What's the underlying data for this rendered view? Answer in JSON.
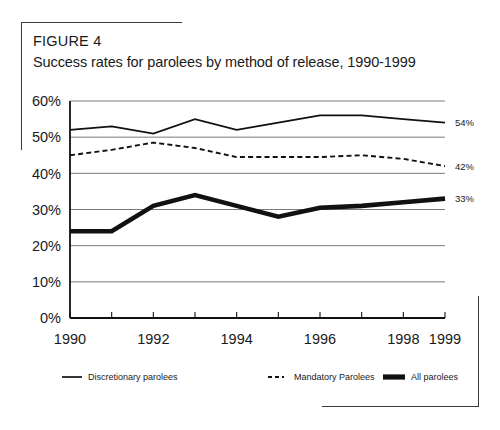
{
  "figure": {
    "label": "FIGURE 4",
    "title": "Success rates for parolees by method of release, 1990-1999"
  },
  "chart_data": {
    "type": "line",
    "title": "Success rates for parolees by method of release, 1990-1999",
    "xlabel": "",
    "ylabel": "",
    "x": [
      1990,
      1991,
      1992,
      1993,
      1994,
      1995,
      1996,
      1997,
      1998,
      1999
    ],
    "categories": [
      "1990",
      "1991",
      "1992",
      "1993",
      "1994",
      "1995",
      "1996",
      "1997",
      "1998",
      "1999"
    ],
    "xtick_labels": [
      "1990",
      "",
      "1992",
      "",
      "1994",
      "",
      "1996",
      "",
      "1998",
      "1999"
    ],
    "ytick_labels": [
      "0%",
      "10%",
      "20%",
      "30%",
      "40%",
      "50%",
      "60%"
    ],
    "ytick_values": [
      0,
      10,
      20,
      30,
      40,
      50,
      60
    ],
    "ylim": [
      0,
      60
    ],
    "xlim": [
      1990,
      1999
    ],
    "grid": "horizontal",
    "legend_position": "bottom",
    "series": [
      {
        "name": "Discretionary parolees",
        "style": "solid",
        "values": [
          52,
          53,
          51,
          55,
          52,
          54,
          56,
          56,
          55,
          54
        ],
        "end_label": "54%"
      },
      {
        "name": "Mandatory Parolees",
        "style": "dashed",
        "values": [
          45,
          46.5,
          48.5,
          47,
          44.5,
          44.5,
          44.5,
          45,
          44,
          42
        ],
        "end_label": "42%"
      },
      {
        "name": "All parolees",
        "style": "thick-solid",
        "values": [
          24,
          24,
          31,
          34,
          31,
          28,
          30.5,
          31,
          32,
          33
        ],
        "end_label": "33%"
      }
    ],
    "annotations": [
      {
        "text": "54%",
        "series": "Discretionary parolees",
        "at_x": 1999
      },
      {
        "text": "42%",
        "series": "Mandatory Parolees",
        "at_x": 1999
      },
      {
        "text": "33%",
        "series": "All parolees",
        "at_x": 1999
      }
    ]
  },
  "legend": {
    "items": [
      {
        "label": "Discretionary parolees",
        "marker": "solid-line-icon"
      },
      {
        "label": "Mandatory Parolees",
        "marker": "dashed-line-icon"
      },
      {
        "label": "All parolees",
        "marker": "thick-line-icon"
      }
    ]
  },
  "colors": {
    "ink": "#111111",
    "grid": "#6b6b6b",
    "background": "#ffffff"
  }
}
